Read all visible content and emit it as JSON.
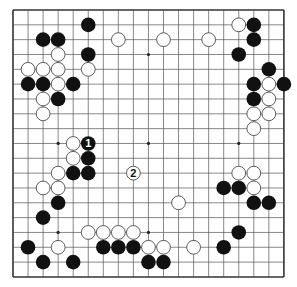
{
  "diagram": {
    "type": "go-board",
    "size": 19,
    "colors": {
      "background": "#ffffff",
      "grid": "#555555",
      "border": "#333333",
      "black_stone": "#111111",
      "white_stone": "#ffffff",
      "white_stone_outline": "#333333"
    },
    "geometry": {
      "origin_x": 13,
      "origin_y": 10,
      "step_x": 15.05,
      "step_y": 14.83,
      "stone_radius": 7.3
    },
    "star_points": [
      [
        3,
        3
      ],
      [
        9,
        3
      ],
      [
        15,
        3
      ],
      [
        3,
        9
      ],
      [
        9,
        9
      ],
      [
        15,
        9
      ],
      [
        3,
        15
      ],
      [
        9,
        15
      ],
      [
        15,
        15
      ]
    ],
    "black_stones": [
      [
        5,
        1
      ],
      [
        2,
        2
      ],
      [
        3,
        2
      ],
      [
        5,
        3
      ],
      [
        1,
        5
      ],
      [
        2,
        5
      ],
      [
        4,
        5
      ],
      [
        3,
        6
      ],
      [
        16,
        1
      ],
      [
        16,
        2
      ],
      [
        15,
        3
      ],
      [
        17,
        4
      ],
      [
        16,
        5
      ],
      [
        18,
        5
      ],
      [
        16,
        6
      ],
      [
        5,
        10
      ],
      [
        4,
        11
      ],
      [
        5,
        11
      ],
      [
        3,
        13
      ],
      [
        2,
        14
      ],
      [
        1,
        16
      ],
      [
        6,
        16
      ],
      [
        7,
        16
      ],
      [
        8,
        16
      ],
      [
        2,
        17
      ],
      [
        4,
        17
      ],
      [
        9,
        17
      ],
      [
        10,
        17
      ],
      [
        14,
        12
      ],
      [
        15,
        12
      ],
      [
        16,
        13
      ],
      [
        17,
        13
      ],
      [
        15,
        15
      ],
      [
        14,
        16
      ]
    ],
    "white_stones": [
      [
        7,
        2
      ],
      [
        10,
        2
      ],
      [
        13,
        2
      ],
      [
        3,
        3
      ],
      [
        1,
        4
      ],
      [
        2,
        4
      ],
      [
        3,
        4
      ],
      [
        5,
        4
      ],
      [
        3,
        5
      ],
      [
        2,
        6
      ],
      [
        2,
        7
      ],
      [
        15,
        1
      ],
      [
        17,
        5
      ],
      [
        17,
        6
      ],
      [
        16,
        7
      ],
      [
        17,
        7
      ],
      [
        16,
        8
      ],
      [
        4,
        9
      ],
      [
        4,
        10
      ],
      [
        3,
        11
      ],
      [
        2,
        12
      ],
      [
        3,
        12
      ],
      [
        5,
        15
      ],
      [
        6,
        15
      ],
      [
        7,
        15
      ],
      [
        8,
        15
      ],
      [
        3,
        16
      ],
      [
        9,
        16
      ],
      [
        10,
        16
      ],
      [
        12,
        16
      ],
      [
        11,
        13
      ],
      [
        15,
        11
      ],
      [
        16,
        11
      ],
      [
        16,
        12
      ]
    ],
    "numbered_moves": [
      {
        "label": "1",
        "color": "black",
        "point": [
          5,
          9
        ]
      },
      {
        "label": "2",
        "color": "white",
        "point": [
          8,
          11
        ]
      }
    ]
  }
}
